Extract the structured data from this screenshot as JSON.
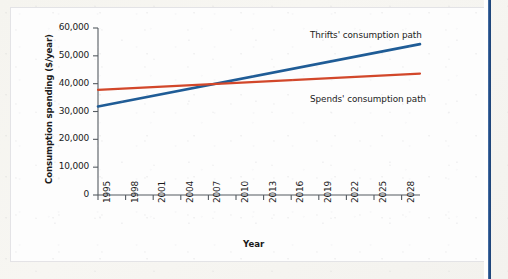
{
  "figure": {
    "background_color": "#fdfdfd",
    "page_color": "#f4f3ee",
    "side_rule_color": "#24508c"
  },
  "chart_data": {
    "type": "line",
    "title": "",
    "xlabel": "Year",
    "ylabel": "Consumption spending ($/year)",
    "xlim": [
      1995,
      2030
    ],
    "ylim": [
      0,
      60000
    ],
    "grid": false,
    "legend_position": "inline-annotations",
    "xticks": [
      1995,
      1998,
      2001,
      2004,
      2007,
      2010,
      2013,
      2016,
      2019,
      2022,
      2025,
      2028
    ],
    "xtick_labels": [
      "1995",
      "1998",
      "2001",
      "2004",
      "2007",
      "2010",
      "2013",
      "2016",
      "2019",
      "2022",
      "2025",
      "2028"
    ],
    "yticks": [
      0,
      10000,
      20000,
      30000,
      40000,
      50000,
      60000
    ],
    "ytick_labels": [
      "0",
      "10,000",
      "20,000",
      "30,000",
      "40,000",
      "50,000",
      "60,000"
    ],
    "series": [
      {
        "name": "Thrifts' consumption path",
        "color": "#1f5c96",
        "annotation": "Thrifts' consumption path",
        "x": [
          1995,
          2030
        ],
        "values": [
          31800,
          54200
        ]
      },
      {
        "name": "Spends' consumption path",
        "color": "#d2472a",
        "annotation": "Spends' consumption path",
        "x": [
          1995,
          2030
        ],
        "values": [
          37800,
          43600
        ]
      }
    ],
    "annotations": [
      {
        "text": "Thrifts' consumption path",
        "x": 2015,
        "y": 57500
      },
      {
        "text": "Spends' consumption path",
        "x": 2015,
        "y": 35500
      }
    ],
    "crossover": {
      "year": 2011,
      "value": 40000
    }
  }
}
